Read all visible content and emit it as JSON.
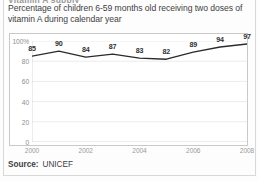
{
  "figure": {
    "clipped_header": "Vitamin A supply",
    "title": "Percentage of children 6-59 months old receiving two doses of vitamin A during calendar year",
    "source_label": "Source:",
    "source_value": "UNICEF"
  },
  "chart_data": {
    "type": "line",
    "title": "Percentage of children 6-59 months old receiving two doses of vitamin A during calendar year",
    "xlabel": "",
    "ylabel": "",
    "x": [
      2000,
      2001,
      2002,
      2003,
      2004,
      2005,
      2006,
      2007,
      2008
    ],
    "categories": [
      "2000",
      "2001",
      "2002",
      "2003",
      "2004",
      "2005",
      "2006",
      "2007",
      "2008"
    ],
    "values": [
      85,
      90,
      84,
      87,
      83,
      82,
      89,
      94,
      97
    ],
    "point_labels": [
      "85",
      "90",
      "84",
      "87",
      "83",
      "82",
      "89",
      "94",
      "97"
    ],
    "series": [
      {
        "name": "Two doses of vitamin A coverage",
        "values": [
          85,
          90,
          84,
          87,
          83,
          82,
          89,
          94,
          97
        ],
        "color": "#2b2b2b"
      }
    ],
    "ylim": [
      0,
      100
    ],
    "xlim": [
      2000,
      2008
    ],
    "ytick_values": [
      0,
      20,
      40,
      60,
      80,
      100
    ],
    "ytick_labels": [
      "0",
      "20",
      "40",
      "60",
      "80",
      "100%"
    ],
    "xtick_values": [
      2000,
      2002,
      2004,
      2006,
      2008
    ],
    "xtick_labels": [
      "2000",
      "2002",
      "2004",
      "2006",
      "2008"
    ],
    "grid": true,
    "grid_axis": "y",
    "legend": false,
    "legend_position": "none",
    "line_color": "#2b2b2b",
    "grid_color": "#e2e2e2",
    "axis_color": "#c9c9c9"
  }
}
